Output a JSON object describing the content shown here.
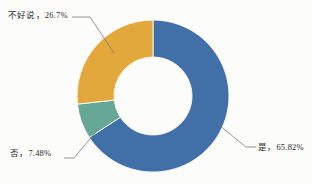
{
  "chart_data": {
    "type": "pie",
    "variant": "donut",
    "title": "",
    "subtitle": "",
    "xlabel": "",
    "ylabel": "",
    "legend": "none",
    "grid": false,
    "labels_show_percent": true,
    "start_angle_deg": 0,
    "direction": "clockwise",
    "categories": [
      "是",
      "否",
      "不好说"
    ],
    "values": [
      65.82,
      7.48,
      26.7
    ],
    "slices": [
      {
        "name": "是",
        "value": 65.82,
        "percent_text": "65.82%",
        "label_text": "是，65.82%",
        "color": "#4170a8"
      },
      {
        "name": "否",
        "value": 7.48,
        "percent_text": "7.48%",
        "label_text": "否，7.48%",
        "color": "#65a895"
      },
      {
        "name": "不好说",
        "value": 26.7,
        "percent_text": "26.7%",
        "label_text": "不好说，26.7%",
        "color": "#e3a83c"
      }
    ]
  },
  "style": {
    "background": "#fcfcfb",
    "leader_line_color": "#7a7a7a",
    "hole_color": "#ffffff",
    "text_color": "#2b2b2b"
  },
  "geometry": {
    "center_x": 153,
    "center_y": 96,
    "outer_radius": 76,
    "inner_radius": 39
  }
}
